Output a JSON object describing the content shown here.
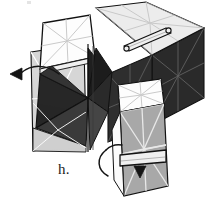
{
  "figure": {
    "step_label": "h.",
    "caption": "",
    "background_color": "#ffffff",
    "width": 214,
    "height": 211
  },
  "palette": {
    "background": "#ffffff",
    "face_white": "#fdfdfd",
    "face_very_light": "#ececec",
    "face_light_gray": "#d6d6d6",
    "face_mid_gray": "#a8a8a8",
    "face_dark_gray": "#6e6e6e",
    "face_near_black": "#2b2b2b",
    "face_black": "#171717",
    "outline": "#111111",
    "star_line_on_dark": "#8d8d8d",
    "star_line_on_light": "#ffffff",
    "star_line_on_pale": "#c9c9c9",
    "tab_fill": "#efefef",
    "arrow_stroke": "#141414",
    "label_color": "#1a1a1a"
  },
  "parts": [
    {
      "id": "top-face-right-box",
      "name": "top-face-right-box",
      "shade": "very-light",
      "has_star": true
    },
    {
      "id": "front-face-right-box",
      "name": "front-face-right-box",
      "shade": "near-black",
      "has_star": true
    },
    {
      "id": "side-face-right-box",
      "name": "side-face-right-box",
      "shade": "near-black",
      "has_star": true
    },
    {
      "id": "upper-left-flap",
      "name": "upper-left-flap",
      "shade": "white",
      "has_star": true
    },
    {
      "id": "left-face-panel",
      "name": "left-face-panel",
      "shade": "light-gray",
      "has_star": true
    },
    {
      "id": "center-pinwheel",
      "name": "center-pinwheel",
      "shade": "black",
      "has_star": false
    },
    {
      "id": "lower-right-flap-top",
      "name": "lower-right-flap-top",
      "shade": "white",
      "has_star": true
    },
    {
      "id": "lower-right-flap",
      "name": "lower-right-flap",
      "shade": "mid-gray",
      "has_star": true
    }
  ],
  "tabs": [
    {
      "id": "tab-top",
      "name": "tab-strip-top",
      "label": ""
    },
    {
      "id": "tab-lower",
      "name": "tab-strip-lower",
      "label": ""
    }
  ],
  "arrows": [
    {
      "id": "arrow-left",
      "name": "fold-arrow-left",
      "direction": "left",
      "style": "curved"
    },
    {
      "id": "arrow-lower",
      "name": "fold-arrow-lower-right",
      "direction": "right",
      "style": "curved"
    },
    {
      "id": "arrow-head-down",
      "name": "insert-arrow-down",
      "direction": "down",
      "style": "straight"
    }
  ]
}
